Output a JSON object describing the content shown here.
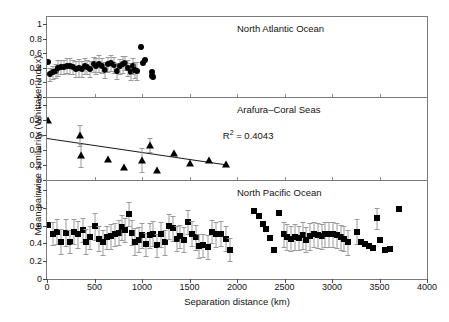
{
  "axes": {
    "ylabel": "Mean pairwise similarity (Whittaker Index)",
    "xlabel": "Separation distance (km)",
    "xticks": [
      0,
      500,
      1000,
      1500,
      2000,
      2500,
      3000,
      3500,
      4000
    ],
    "yticks": [
      "0",
      "0.2",
      "0.4",
      "0.6",
      "0.8",
      "1"
    ],
    "xlim": [
      0,
      4000
    ],
    "ylim": [
      0,
      1.1
    ]
  },
  "annotations": {
    "r2_label": "R2 = 0.4043",
    "r2_prefix": "R",
    "r2_sup": "2",
    "r2_value": " = 0.4043"
  },
  "caption": "",
  "chart_data": [
    {
      "type": "scatter",
      "title": "North Atlantic Ocean",
      "marker": "circle",
      "xlabel": "Separation distance (km)",
      "ylabel": "Mean pairwise similarity (Whittaker Index)",
      "xlim": [
        0,
        4000
      ],
      "ylim": [
        0,
        1.1
      ],
      "grid": false,
      "legend": "none",
      "points": [
        {
          "x": 10,
          "y": 0.48,
          "err": 0.0
        },
        {
          "x": 30,
          "y": 0.31,
          "err": 0.09
        },
        {
          "x": 60,
          "y": 0.34,
          "err": 0.09
        },
        {
          "x": 90,
          "y": 0.36,
          "err": 0.1
        },
        {
          "x": 120,
          "y": 0.4,
          "err": 0.11
        },
        {
          "x": 150,
          "y": 0.41,
          "err": 0.1
        },
        {
          "x": 180,
          "y": 0.41,
          "err": 0.1
        },
        {
          "x": 215,
          "y": 0.43,
          "err": 0.1
        },
        {
          "x": 245,
          "y": 0.43,
          "err": 0.11
        },
        {
          "x": 275,
          "y": 0.41,
          "err": 0.1
        },
        {
          "x": 305,
          "y": 0.39,
          "err": 0.11
        },
        {
          "x": 335,
          "y": 0.4,
          "err": 0.12
        },
        {
          "x": 365,
          "y": 0.38,
          "err": 0.11
        },
        {
          "x": 395,
          "y": 0.42,
          "err": 0.11
        },
        {
          "x": 425,
          "y": 0.41,
          "err": 0.1
        },
        {
          "x": 455,
          "y": 0.39,
          "err": 0.11
        },
        {
          "x": 490,
          "y": 0.45,
          "err": 0.1
        },
        {
          "x": 520,
          "y": 0.42,
          "err": 0.11
        },
        {
          "x": 550,
          "y": 0.46,
          "err": 0.12
        },
        {
          "x": 580,
          "y": 0.43,
          "err": 0.1
        },
        {
          "x": 610,
          "y": 0.37,
          "err": 0.11
        },
        {
          "x": 645,
          "y": 0.45,
          "err": 0.1
        },
        {
          "x": 675,
          "y": 0.47,
          "err": 0.11
        },
        {
          "x": 705,
          "y": 0.44,
          "err": 0.11
        },
        {
          "x": 735,
          "y": 0.36,
          "err": 0.11
        },
        {
          "x": 765,
          "y": 0.42,
          "err": 0.1
        },
        {
          "x": 795,
          "y": 0.45,
          "err": 0.12
        },
        {
          "x": 825,
          "y": 0.47,
          "err": 0.1
        },
        {
          "x": 855,
          "y": 0.4,
          "err": 0.11
        },
        {
          "x": 880,
          "y": 0.35,
          "err": 0.12
        },
        {
          "x": 905,
          "y": 0.42,
          "err": 0.11
        },
        {
          "x": 930,
          "y": 0.37,
          "err": 0.11
        },
        {
          "x": 950,
          "y": 0.36,
          "err": 0.12
        },
        {
          "x": 985,
          "y": 0.69,
          "err": 0.0
        },
        {
          "x": 1010,
          "y": 0.47,
          "err": 0.0
        },
        {
          "x": 1035,
          "y": 0.51,
          "err": 0.0
        },
        {
          "x": 1105,
          "y": 0.34,
          "err": 0.0
        },
        {
          "x": 1110,
          "y": 0.29,
          "err": 0.0
        },
        {
          "x": 1115,
          "y": 0.27,
          "err": 0.0
        }
      ]
    },
    {
      "type": "scatter",
      "title": "Arafura–Coral Seas",
      "marker": "triangle",
      "xlabel": "Separation distance (km)",
      "ylabel": "Mean pairwise similarity (Whittaker Index)",
      "xlim": [
        0,
        4000
      ],
      "ylim": [
        0,
        1.1
      ],
      "grid": false,
      "legend": "none",
      "r2": 0.4043,
      "trendline": {
        "x0": 0,
        "y0": 0.56,
        "x1": 1900,
        "y1": 0.205
      },
      "points": [
        {
          "x": 15,
          "y": 0.8,
          "err": 0.0
        },
        {
          "x": 350,
          "y": 0.6,
          "err": 0.14
        },
        {
          "x": 360,
          "y": 0.33,
          "err": 0.15
        },
        {
          "x": 640,
          "y": 0.28,
          "err": 0.0
        },
        {
          "x": 810,
          "y": 0.18,
          "err": 0.0
        },
        {
          "x": 1000,
          "y": 0.27,
          "err": 0.16
        },
        {
          "x": 1080,
          "y": 0.47,
          "err": 0.1
        },
        {
          "x": 1160,
          "y": 0.14,
          "err": 0.0
        },
        {
          "x": 1340,
          "y": 0.36,
          "err": 0.0
        },
        {
          "x": 1510,
          "y": 0.23,
          "err": 0.0
        },
        {
          "x": 1700,
          "y": 0.27,
          "err": 0.0
        },
        {
          "x": 1880,
          "y": 0.21,
          "err": 0.0
        }
      ]
    },
    {
      "type": "scatter",
      "title": "North Pacific Ocean",
      "marker": "square",
      "xlabel": "Separation distance (km)",
      "ylabel": "Mean pairwise similarity (Whittaker Index)",
      "xlim": [
        0,
        4000
      ],
      "ylim": [
        0,
        1.1
      ],
      "grid": false,
      "legend": "none",
      "points": [
        {
          "x": 15,
          "y": 0.61,
          "err": 0.0
        },
        {
          "x": 60,
          "y": 0.51,
          "err": 0.13
        },
        {
          "x": 110,
          "y": 0.53,
          "err": 0.14
        },
        {
          "x": 150,
          "y": 0.42,
          "err": 0.14
        },
        {
          "x": 195,
          "y": 0.52,
          "err": 0.15
        },
        {
          "x": 240,
          "y": 0.42,
          "err": 0.13
        },
        {
          "x": 285,
          "y": 0.53,
          "err": 0.14
        },
        {
          "x": 330,
          "y": 0.5,
          "err": 0.15
        },
        {
          "x": 375,
          "y": 0.55,
          "err": 0.14
        },
        {
          "x": 415,
          "y": 0.42,
          "err": 0.14
        },
        {
          "x": 455,
          "y": 0.47,
          "err": 0.13
        },
        {
          "x": 500,
          "y": 0.59,
          "err": 0.15
        },
        {
          "x": 545,
          "y": 0.45,
          "err": 0.14
        },
        {
          "x": 590,
          "y": 0.41,
          "err": 0.14
        },
        {
          "x": 630,
          "y": 0.47,
          "err": 0.13
        },
        {
          "x": 675,
          "y": 0.48,
          "err": 0.14
        },
        {
          "x": 715,
          "y": 0.5,
          "err": 0.13
        },
        {
          "x": 755,
          "y": 0.52,
          "err": 0.14
        },
        {
          "x": 790,
          "y": 0.58,
          "err": 0.14
        },
        {
          "x": 825,
          "y": 0.55,
          "err": 0.13
        },
        {
          "x": 860,
          "y": 0.73,
          "err": 0.13
        },
        {
          "x": 895,
          "y": 0.52,
          "err": 0.14
        },
        {
          "x": 930,
          "y": 0.42,
          "err": 0.15
        },
        {
          "x": 965,
          "y": 0.44,
          "err": 0.14
        },
        {
          "x": 1000,
          "y": 0.49,
          "err": 0.14
        },
        {
          "x": 1040,
          "y": 0.39,
          "err": 0.13
        },
        {
          "x": 1080,
          "y": 0.49,
          "err": 0.14
        },
        {
          "x": 1120,
          "y": 0.51,
          "err": 0.14
        },
        {
          "x": 1160,
          "y": 0.38,
          "err": 0.13
        },
        {
          "x": 1200,
          "y": 0.5,
          "err": 0.14
        },
        {
          "x": 1245,
          "y": 0.41,
          "err": 0.14
        },
        {
          "x": 1285,
          "y": 0.59,
          "err": 0.14
        },
        {
          "x": 1325,
          "y": 0.57,
          "err": 0.14
        },
        {
          "x": 1365,
          "y": 0.45,
          "err": 0.14
        },
        {
          "x": 1405,
          "y": 0.48,
          "err": 0.13
        },
        {
          "x": 1445,
          "y": 0.44,
          "err": 0.14
        },
        {
          "x": 1485,
          "y": 0.64,
          "err": 0.13
        },
        {
          "x": 1525,
          "y": 0.51,
          "err": 0.14
        },
        {
          "x": 1565,
          "y": 0.47,
          "err": 0.14
        },
        {
          "x": 1605,
          "y": 0.37,
          "err": 0.13
        },
        {
          "x": 1645,
          "y": 0.38,
          "err": 0.13
        },
        {
          "x": 1690,
          "y": 0.36,
          "err": 0.13
        },
        {
          "x": 1735,
          "y": 0.53,
          "err": 0.13
        },
        {
          "x": 1780,
          "y": 0.5,
          "err": 0.14
        },
        {
          "x": 1830,
          "y": 0.51,
          "err": 0.14
        },
        {
          "x": 1880,
          "y": 0.45,
          "err": 0.14
        },
        {
          "x": 1930,
          "y": 0.33,
          "err": 0.13
        },
        {
          "x": 2180,
          "y": 0.76,
          "err": 0.0
        },
        {
          "x": 2230,
          "y": 0.71,
          "err": 0.0
        },
        {
          "x": 2270,
          "y": 0.62,
          "err": 0.0
        },
        {
          "x": 2310,
          "y": 0.56,
          "err": 0.0
        },
        {
          "x": 2345,
          "y": 0.46,
          "err": 0.0
        },
        {
          "x": 2385,
          "y": 0.32,
          "err": 0.0
        },
        {
          "x": 2440,
          "y": 0.74,
          "err": 0.0
        },
        {
          "x": 2490,
          "y": 0.5,
          "err": 0.14
        },
        {
          "x": 2530,
          "y": 0.47,
          "err": 0.15
        },
        {
          "x": 2570,
          "y": 0.45,
          "err": 0.14
        },
        {
          "x": 2610,
          "y": 0.47,
          "err": 0.15
        },
        {
          "x": 2650,
          "y": 0.46,
          "err": 0.14
        },
        {
          "x": 2690,
          "y": 0.49,
          "err": 0.15
        },
        {
          "x": 2730,
          "y": 0.44,
          "err": 0.14
        },
        {
          "x": 2770,
          "y": 0.48,
          "err": 0.15
        },
        {
          "x": 2810,
          "y": 0.5,
          "err": 0.14
        },
        {
          "x": 2850,
          "y": 0.49,
          "err": 0.14
        },
        {
          "x": 2890,
          "y": 0.48,
          "err": 0.14
        },
        {
          "x": 2930,
          "y": 0.5,
          "err": 0.14
        },
        {
          "x": 2970,
          "y": 0.5,
          "err": 0.14
        },
        {
          "x": 3010,
          "y": 0.5,
          "err": 0.14
        },
        {
          "x": 3050,
          "y": 0.49,
          "err": 0.14
        },
        {
          "x": 3090,
          "y": 0.47,
          "err": 0.14
        },
        {
          "x": 3130,
          "y": 0.45,
          "err": 0.14
        },
        {
          "x": 3170,
          "y": 0.41,
          "err": 0.14
        },
        {
          "x": 3265,
          "y": 0.53,
          "err": 0.14
        },
        {
          "x": 3310,
          "y": 0.41,
          "err": 0.0
        },
        {
          "x": 3350,
          "y": 0.39,
          "err": 0.0
        },
        {
          "x": 3390,
          "y": 0.37,
          "err": 0.0
        },
        {
          "x": 3430,
          "y": 0.35,
          "err": 0.0
        },
        {
          "x": 3470,
          "y": 0.68,
          "err": 0.12
        },
        {
          "x": 3510,
          "y": 0.44,
          "err": 0.0
        },
        {
          "x": 3560,
          "y": 0.33,
          "err": 0.0
        },
        {
          "x": 3610,
          "y": 0.34,
          "err": 0.0
        },
        {
          "x": 3700,
          "y": 0.79,
          "err": 0.0
        }
      ]
    }
  ]
}
